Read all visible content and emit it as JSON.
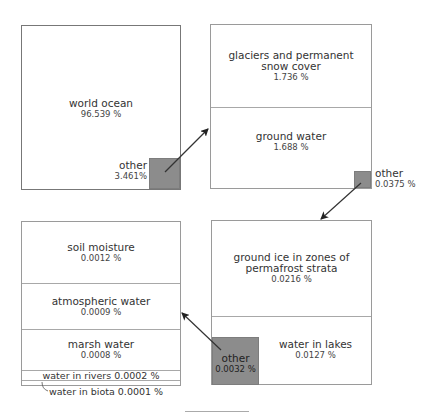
{
  "diagram": {
    "type": "nested breakdown of world water distribution",
    "level1": {
      "main": {
        "name": "world ocean",
        "value": "96.539 %"
      },
      "other": {
        "name": "other",
        "value": "3.461%"
      }
    },
    "level2": {
      "items": [
        {
          "name": "glaciers and permanent snow cover",
          "value": "1.736 %"
        },
        {
          "name": "ground water",
          "value": "1.688 %"
        }
      ],
      "other": {
        "name": "other",
        "value": "0.0375 %"
      }
    },
    "level3": {
      "items": [
        {
          "name": "ground ice in zones of permafrost strata",
          "value": "0.0216 %"
        },
        {
          "name": "water in lakes",
          "value": "0.0127 %"
        }
      ],
      "other": {
        "name": "other",
        "value": "0.0032 %"
      }
    },
    "level4": {
      "items": [
        {
          "name": "soil moisture",
          "value": "0.0012 %"
        },
        {
          "name": "atmospheric water",
          "value": "0.0009 %"
        },
        {
          "name": "marsh water",
          "value": "0.0008 %"
        },
        {
          "name": "water in rivers",
          "value": "0.0002 %"
        },
        {
          "name": "water in biota",
          "value": "0.0001 %"
        }
      ]
    },
    "colors": {
      "other_fill": "#8c8c8c",
      "border": "#9a9a9a",
      "arrow": "#333333"
    }
  },
  "labels": {
    "glaciers_line1": "glaciers and permanent",
    "glaciers_line2": "snow cover",
    "ground_ice_line1": "ground ice in zones of",
    "ground_ice_line2": "permafrost strata",
    "rivers_full": "water in rivers 0.0002 %",
    "biota_full": "water in biota 0.0001 %"
  }
}
